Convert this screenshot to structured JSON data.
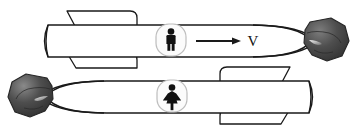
{
  "figure": {
    "background_color": "#ffffff",
    "outline_color": "#1a1a1a",
    "body_fill": "#ffffff",
    "rock_fill_dark": "#3a3a3a",
    "rock_fill_mid": "#5a5a5a",
    "rock_fill_light": "#8e8e8e",
    "icon_fill": "#111111",
    "icon_panel_fill": "#fafafa"
  },
  "annotations": {
    "velocity_label": "V",
    "velocity_arrow_name": "velocity-arrow"
  },
  "vehicles": [
    {
      "id": "top-rocket",
      "name": "rocket-upper",
      "direction": "right",
      "occupant_icon": "male-figure-icon",
      "occupant_label": "man",
      "has_velocity_arrow": true,
      "velocity_label": "V",
      "nose_rock": "rock-right",
      "fins": [
        "fin-top",
        "fin-bottom"
      ]
    },
    {
      "id": "bottom-rocket",
      "name": "rocket-lower",
      "direction": "left",
      "occupant_icon": "female-figure-icon",
      "occupant_label": "woman",
      "has_velocity_arrow": false,
      "velocity_label": "",
      "nose_rock": "rock-left",
      "fins": [
        "fin-top",
        "fin-bottom"
      ]
    }
  ]
}
